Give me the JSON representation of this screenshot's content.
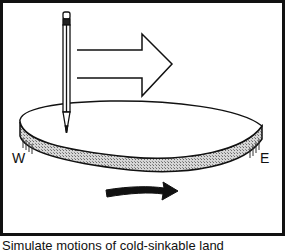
{
  "figure": {
    "labels": {
      "west": "W",
      "east": "E"
    },
    "caption": "Simulate motions of cold-sinkable land",
    "elements": {
      "pencil": "pencil-icon",
      "large_arrow": "outline-arrow-right",
      "rotation_arrow": "curved-arrow-right",
      "disk": "rotating-disk"
    },
    "colors": {
      "stroke": "#111111",
      "background": "#ffffff",
      "disk_edge_fill": "#bdbdbd"
    }
  }
}
